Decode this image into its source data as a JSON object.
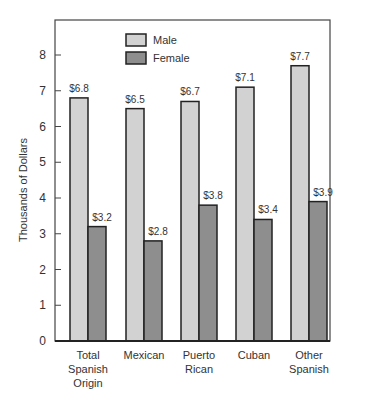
{
  "chart_data": {
    "type": "bar",
    "title": "",
    "xlabel": "",
    "ylabel": "Thousands of Dollars",
    "ylim": [
      0,
      8.8
    ],
    "yticks": [
      0,
      1,
      2,
      3,
      4,
      5,
      6,
      7,
      8
    ],
    "categories": [
      [
        "Total",
        "Spanish",
        "Origin"
      ],
      [
        "Mexican"
      ],
      [
        "Puerto",
        "Rican"
      ],
      [
        "Cuban"
      ],
      [
        "Other",
        "Spanish"
      ]
    ],
    "series": [
      {
        "name": "Male",
        "color": "#d2d2d2",
        "values": [
          6.8,
          6.5,
          6.7,
          7.1,
          7.7
        ],
        "labels": [
          "$6.8",
          "$6.5",
          "$6.7",
          "$7.1",
          "$7.7"
        ]
      },
      {
        "name": "Female",
        "color": "#8e8e8e",
        "values": [
          3.2,
          2.8,
          3.8,
          3.4,
          3.9
        ],
        "labels": [
          "$3.2",
          "$2.8",
          "$3.8",
          "$3.4",
          "$3.9"
        ]
      }
    ],
    "legend_position": "top-center",
    "grid": false
  }
}
